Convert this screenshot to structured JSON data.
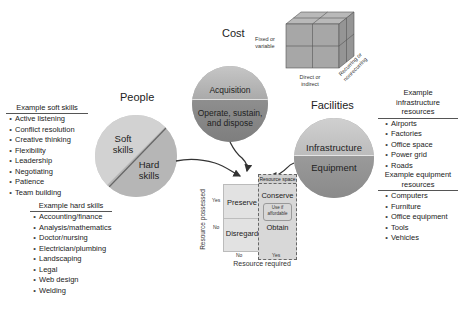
{
  "cost": {
    "title": "Cost",
    "circle": {
      "top": "Acquisition",
      "bottom_line1": "Operate, sustain,",
      "bottom_line2": "and dispose"
    },
    "cube_labels": {
      "front_left": "Fixed or\nvariable",
      "front_left_line1": "Fixed or",
      "front_left_line2": "variable",
      "bottom_line1": "Direct or",
      "bottom_line2": "indirect",
      "side_line1": "Recurring or",
      "side_line2": "nonrecurring"
    }
  },
  "people": {
    "title": "People",
    "circle": {
      "top_line1": "Soft",
      "top_line2": "skills",
      "bottom_line1": "Hard",
      "bottom_line2": "skills"
    },
    "soft_skills": {
      "heading": "Example soft skills",
      "items": [
        "Active listening",
        "Conflict resolution",
        "Creative thinking",
        "Flexibility",
        "Leadership",
        "Negotiating",
        "Patience",
        "Team building"
      ]
    },
    "hard_skills": {
      "heading": "Example hard skills",
      "items": [
        "Accounting/finance",
        "Analysis/mathematics",
        "Doctor/nursing",
        "Electrician/plumbing",
        "Landscaping",
        "Legal",
        "Web design",
        "Welding"
      ]
    }
  },
  "facilities": {
    "title": "Facilities",
    "circle": {
      "top": "Infrastructure",
      "bottom": "Equipment"
    },
    "infrastructure": {
      "heading_line1": "Example",
      "heading_line2": "infrastructure",
      "heading_line3": "resources",
      "items": [
        "Airports",
        "Factories",
        "Office space",
        "Power grid",
        "Roads"
      ]
    },
    "equipment": {
      "heading_line1": "Example equipment",
      "heading_line2": "resources",
      "items": [
        "Computers",
        "Furniture",
        "Office equipment",
        "Tools",
        "Vehicles"
      ]
    }
  },
  "matrix": {
    "resource_space": "Resource space",
    "y_axis": "Resource possessed",
    "x_axis": "Resource required",
    "y_yes": "Yes",
    "y_no": "No",
    "x_no": "No",
    "x_yes": "Yes",
    "cells": {
      "preserve": "Preserve",
      "conserve": "Conserve",
      "disregard": "Disregard",
      "obtain": "Obtain",
      "use_if_line1": "Use if",
      "use_if_line2": "affordable"
    }
  },
  "colors": {
    "light_gray": "#d4d4d4",
    "mid_gray": "#a9a9a9",
    "dark_gray": "#8a8a8a",
    "cube": "#a7a7a7"
  }
}
